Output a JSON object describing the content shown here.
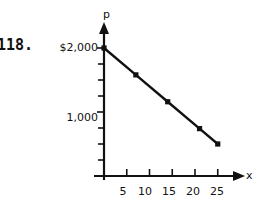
{
  "problem": {
    "number": "118."
  },
  "axes": {
    "y_axis_name": "p",
    "x_axis_name": "x"
  },
  "y_tick_labels": [
    {
      "text": "$2,000",
      "value": 2000
    },
    {
      "text": "1,000",
      "value": 1000
    }
  ],
  "x_tick_labels": [
    {
      "text": "5",
      "value": 5
    },
    {
      "text": "10",
      "value": 10
    },
    {
      "text": "15",
      "value": 15
    },
    {
      "text": "20",
      "value": 20
    },
    {
      "text": "25",
      "value": 25
    }
  ],
  "colors": {
    "ink": "#111111",
    "background": "#ffffff"
  },
  "chart_data": {
    "type": "line",
    "title": "",
    "xlabel": "x",
    "ylabel": "p",
    "grid": false,
    "legend": null,
    "xlim": [
      0,
      27
    ],
    "ylim": [
      0,
      2250
    ],
    "x_ticks": [
      5,
      10,
      15,
      20,
      25
    ],
    "x_minor_ticks": [],
    "y_ticks": [
      1000,
      2000
    ],
    "y_minor_ticks": [
      250,
      500,
      750,
      1250,
      1500,
      1750,
      2000
    ],
    "series": [
      {
        "name": "demand",
        "marker": "square",
        "x": [
          0,
          7,
          14,
          21,
          25
        ],
        "values": [
          2000,
          1580,
          1160,
          740,
          500
        ]
      }
    ],
    "line": {
      "intercept": 2000,
      "slope": -60
    }
  }
}
